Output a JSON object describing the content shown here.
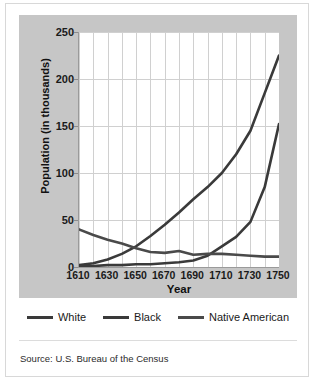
{
  "chart_data": {
    "type": "line",
    "title": "",
    "xlabel": "Year",
    "ylabel": "Population (in thousands)",
    "xlim": [
      1610,
      1750
    ],
    "ylim": [
      0,
      250
    ],
    "grid": true,
    "legend_position": "bottom",
    "x": [
      1610,
      1620,
      1630,
      1640,
      1650,
      1660,
      1670,
      1680,
      1690,
      1700,
      1710,
      1720,
      1730,
      1740,
      1750
    ],
    "x_tick_labels": [
      "1610",
      "1630",
      "1650",
      "1670",
      "1690",
      "1710",
      "1730",
      "1750"
    ],
    "x_tick_values": [
      1610,
      1630,
      1650,
      1670,
      1690,
      1710,
      1730,
      1750
    ],
    "y_tick_labels": [
      "0",
      "50",
      "100",
      "150",
      "200",
      "250"
    ],
    "y_tick_values": [
      0,
      50,
      100,
      150,
      200,
      250
    ],
    "series": [
      {
        "name": "White",
        "color": "#3a3a3a",
        "values": [
          2,
          4,
          8,
          14,
          22,
          33,
          45,
          58,
          72,
          85,
          100,
          120,
          145,
          185,
          225
        ]
      },
      {
        "name": "Black",
        "color": "#3a3a3a",
        "values": [
          1,
          1,
          2,
          2,
          3,
          3,
          4,
          5,
          7,
          12,
          22,
          32,
          48,
          85,
          152
        ]
      },
      {
        "name": "Native American",
        "color": "#4a4a4a",
        "values": [
          40,
          34,
          29,
          25,
          20,
          16,
          15,
          17,
          13,
          14,
          14,
          13,
          12,
          11,
          11
        ]
      }
    ],
    "source": "Source: U.S. Bureau of the Census"
  },
  "axes": {
    "x_title": "Year",
    "y_title": "Population (in thousands)"
  },
  "legend": {
    "entries": [
      {
        "label": "White"
      },
      {
        "label": "Black"
      },
      {
        "label": "Native American"
      }
    ]
  },
  "footer": {
    "source_text": "Source: U.S. Bureau of the Census"
  }
}
